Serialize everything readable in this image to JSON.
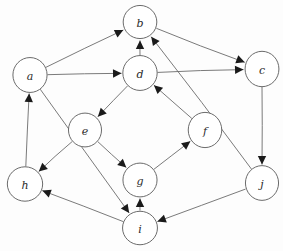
{
  "graph": {
    "title": "Directed graph",
    "style": "hand-drawn circles with arrow edges",
    "node_radius": 17,
    "nodes": [
      {
        "id": "a",
        "label": "a",
        "x": 30,
        "y": 75
      },
      {
        "id": "b",
        "label": "b",
        "x": 140,
        "y": 22
      },
      {
        "id": "c",
        "label": "c",
        "x": 262,
        "y": 69
      },
      {
        "id": "d",
        "label": "d",
        "x": 140,
        "y": 73
      },
      {
        "id": "e",
        "label": "e",
        "x": 85,
        "y": 130
      },
      {
        "id": "f",
        "label": "f",
        "x": 205,
        "y": 130
      },
      {
        "id": "g",
        "label": "g",
        "x": 140,
        "y": 180
      },
      {
        "id": "h",
        "label": "h",
        "x": 25,
        "y": 184
      },
      {
        "id": "i",
        "label": "i",
        "x": 140,
        "y": 228
      },
      {
        "id": "j",
        "label": "j",
        "x": 262,
        "y": 183
      }
    ],
    "edges": [
      {
        "from": "a",
        "to": "b"
      },
      {
        "from": "a",
        "to": "d"
      },
      {
        "from": "a",
        "to": "i"
      },
      {
        "from": "b",
        "to": "c"
      },
      {
        "from": "d",
        "to": "b"
      },
      {
        "from": "d",
        "to": "c"
      },
      {
        "from": "d",
        "to": "e"
      },
      {
        "from": "c",
        "to": "j"
      },
      {
        "from": "f",
        "to": "d"
      },
      {
        "from": "j",
        "to": "b"
      },
      {
        "from": "j",
        "to": "i"
      },
      {
        "from": "g",
        "to": "f"
      },
      {
        "from": "e",
        "to": "g"
      },
      {
        "from": "e",
        "to": "h"
      },
      {
        "from": "i",
        "to": "g"
      },
      {
        "from": "i",
        "to": "h"
      },
      {
        "from": "h",
        "to": "a"
      }
    ],
    "colors": {
      "node_stroke": "#5a5a5a",
      "node_fill": "#ffffff",
      "edge_stroke": "#6b6b6b",
      "arrow_fill": "#1a1a1a",
      "label_fill": "#2b2b2b",
      "background": "#fdfdfd"
    }
  }
}
